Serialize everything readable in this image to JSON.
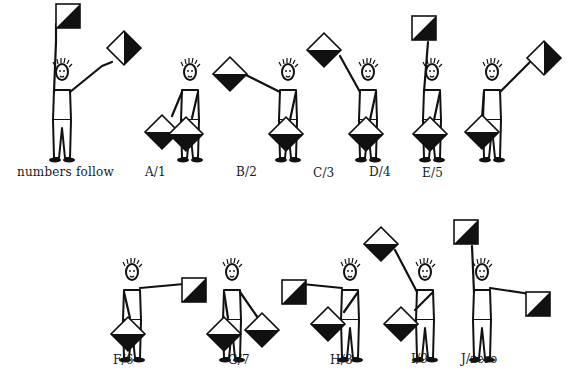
{
  "diagram": {
    "type": "semaphore-alphabet-numbers",
    "rows": [
      {
        "signals": [
          {
            "id": "numbers-follow",
            "label": "numbers follow"
          },
          {
            "id": "a1",
            "label": "A/1"
          },
          {
            "id": "b2",
            "label": "B/2"
          },
          {
            "id": "c3",
            "label": "C/3"
          },
          {
            "id": "d4",
            "label": "D/4"
          },
          {
            "id": "e5",
            "label": "E/5"
          }
        ]
      },
      {
        "signals": [
          {
            "id": "f6",
            "label": "F/6"
          },
          {
            "id": "g7",
            "label": "G/7"
          },
          {
            "id": "h8",
            "label": "H/8"
          },
          {
            "id": "i9",
            "label": "I/9"
          },
          {
            "id": "j0",
            "label": "J/zero"
          }
        ]
      }
    ],
    "colors": {
      "ink": "#111111",
      "background": "#ffffff"
    }
  }
}
